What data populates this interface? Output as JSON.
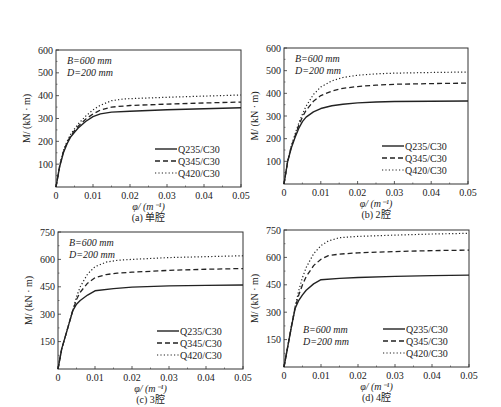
{
  "chart_data": [
    {
      "id": "a",
      "type": "line",
      "caption": "(a) 单腔",
      "xlabel": "φ/ (m⁻¹)",
      "ylabel": "M/ (kN · m)",
      "xlim": [
        0,
        0.05
      ],
      "ylim": [
        0,
        600
      ],
      "xticks": [
        0,
        0.01,
        0.02,
        0.03,
        0.04,
        0.05
      ],
      "xtick_labels": [
        "0",
        "0.01",
        "0.02",
        "0.03",
        "0.04",
        "0.05"
      ],
      "yticks": [
        100,
        200,
        300,
        400,
        500,
        600
      ],
      "ytick_labels": [
        "100",
        "200",
        "300",
        "400",
        "500",
        "600"
      ],
      "annotations": [
        "B=600 mm",
        "D=200 mm"
      ],
      "annotation_position": "top-left",
      "legend_position": "bottom-right",
      "grid": false,
      "series": [
        {
          "name": "Q235/C30",
          "style": "solid",
          "x": [
            0,
            0.001,
            0.002,
            0.003,
            0.004,
            0.005,
            0.006,
            0.008,
            0.01,
            0.012,
            0.015,
            0.02,
            0.03,
            0.04,
            0.05
          ],
          "y": [
            0,
            90,
            150,
            190,
            220,
            240,
            258,
            287,
            308,
            320,
            328,
            332,
            338,
            343,
            347
          ]
        },
        {
          "name": "Q345/C30",
          "style": "dashed",
          "x": [
            0,
            0.001,
            0.002,
            0.003,
            0.004,
            0.005,
            0.006,
            0.008,
            0.01,
            0.012,
            0.015,
            0.02,
            0.03,
            0.04,
            0.05
          ],
          "y": [
            0,
            92,
            155,
            195,
            225,
            247,
            266,
            297,
            320,
            337,
            350,
            357,
            363,
            368,
            372
          ]
        },
        {
          "name": "Q420/C30",
          "style": "dotted",
          "x": [
            0,
            0.001,
            0.002,
            0.003,
            0.004,
            0.005,
            0.006,
            0.008,
            0.01,
            0.012,
            0.015,
            0.018,
            0.02,
            0.03,
            0.04,
            0.05
          ],
          "y": [
            0,
            95,
            160,
            200,
            232,
            255,
            276,
            310,
            338,
            358,
            378,
            385,
            387,
            393,
            398,
            403
          ]
        }
      ]
    },
    {
      "id": "b",
      "type": "line",
      "caption": "(b) 2腔",
      "xlabel": "φ/ (m⁻¹)",
      "ylabel": "M/ (kN · m)",
      "xlim": [
        0,
        0.05
      ],
      "ylim": [
        0,
        600
      ],
      "xticks": [
        0,
        0.01,
        0.02,
        0.03,
        0.04,
        0.05
      ],
      "xtick_labels": [
        "0",
        "0.01",
        "0.02",
        "0.03",
        "0.04",
        "0.05"
      ],
      "yticks": [
        100,
        200,
        300,
        400,
        500,
        600
      ],
      "ytick_labels": [
        "100",
        "200",
        "300",
        "400",
        "500",
        "600"
      ],
      "annotations": [
        "B=600 mm",
        "D=200 mm"
      ],
      "annotation_position": "top-left",
      "legend_position": "bottom-right",
      "grid": false,
      "series": [
        {
          "name": "Q235/C30",
          "style": "solid",
          "x": [
            0,
            0.001,
            0.002,
            0.003,
            0.004,
            0.005,
            0.006,
            0.008,
            0.01,
            0.013,
            0.016,
            0.02,
            0.025,
            0.03,
            0.04,
            0.05
          ],
          "y": [
            0,
            100,
            160,
            205,
            245,
            275,
            295,
            318,
            333,
            345,
            352,
            358,
            362,
            364,
            365,
            366
          ]
        },
        {
          "name": "Q345/C30",
          "style": "dashed",
          "x": [
            0,
            0.001,
            0.002,
            0.003,
            0.004,
            0.005,
            0.006,
            0.008,
            0.01,
            0.013,
            0.016,
            0.02,
            0.025,
            0.03,
            0.04,
            0.05
          ],
          "y": [
            0,
            100,
            165,
            212,
            258,
            295,
            325,
            365,
            390,
            410,
            422,
            430,
            436,
            440,
            443,
            445
          ]
        },
        {
          "name": "Q420/C30",
          "style": "dotted",
          "x": [
            0,
            0.001,
            0.002,
            0.003,
            0.004,
            0.005,
            0.006,
            0.008,
            0.01,
            0.013,
            0.016,
            0.02,
            0.025,
            0.03,
            0.04,
            0.05
          ],
          "y": [
            0,
            102,
            170,
            220,
            268,
            308,
            343,
            395,
            428,
            455,
            470,
            480,
            486,
            489,
            492,
            494
          ]
        }
      ]
    },
    {
      "id": "c",
      "type": "line",
      "caption": "(c) 3腔",
      "xlabel": "φ/ (m⁻¹)",
      "ylabel": "M/ (kN · m)",
      "xlim": [
        0,
        0.05
      ],
      "ylim": [
        0,
        750
      ],
      "xticks": [
        0,
        0.01,
        0.02,
        0.03,
        0.04,
        0.05
      ],
      "xtick_labels": [
        "0",
        "0.01",
        "0.02",
        "0.03",
        "0.04",
        "0.05"
      ],
      "yticks": [
        150,
        300,
        450,
        600,
        750
      ],
      "ytick_labels": [
        "150",
        "300",
        "450",
        "600",
        "750"
      ],
      "annotations": [
        "B=600 mm",
        "D=200 mm"
      ],
      "annotation_position": "top-left",
      "legend_position": "bottom-right",
      "grid": false,
      "series": [
        {
          "name": "Q235/C30",
          "style": "solid",
          "x": [
            0,
            0.001,
            0.002,
            0.003,
            0.004,
            0.005,
            0.006,
            0.008,
            0.01,
            0.015,
            0.02,
            0.03,
            0.04,
            0.05
          ],
          "y": [
            0,
            110,
            180,
            250,
            320,
            355,
            375,
            405,
            428,
            440,
            448,
            455,
            458,
            460
          ]
        },
        {
          "name": "Q345/C30",
          "style": "dashed",
          "x": [
            0,
            0.001,
            0.002,
            0.003,
            0.004,
            0.005,
            0.006,
            0.008,
            0.01,
            0.013,
            0.016,
            0.02,
            0.03,
            0.04,
            0.05
          ],
          "y": [
            0,
            110,
            180,
            250,
            320,
            380,
            420,
            470,
            500,
            517,
            525,
            530,
            540,
            546,
            550
          ]
        },
        {
          "name": "Q420/C30",
          "style": "dotted",
          "x": [
            0,
            0.001,
            0.002,
            0.003,
            0.004,
            0.005,
            0.006,
            0.008,
            0.01,
            0.013,
            0.016,
            0.02,
            0.03,
            0.04,
            0.05
          ],
          "y": [
            0,
            110,
            180,
            250,
            320,
            395,
            450,
            520,
            560,
            585,
            595,
            600,
            610,
            615,
            620
          ]
        }
      ]
    },
    {
      "id": "d",
      "type": "line",
      "caption": "(d) 4腔",
      "xlabel": "φ/ (m⁻¹)",
      "ylabel": "M/ (kN · m)",
      "xlim": [
        0,
        0.05
      ],
      "ylim": [
        0,
        750
      ],
      "xticks": [
        0,
        0.01,
        0.02,
        0.03,
        0.04,
        0.05
      ],
      "xtick_labels": [
        "0",
        "0.01",
        "0.02",
        "0.03",
        "0.04",
        "0.05"
      ],
      "yticks": [
        150,
        300,
        450,
        600,
        750
      ],
      "ytick_labels": [
        "150",
        "300",
        "450",
        "600",
        "750"
      ],
      "annotations": [
        "B=600 mm",
        "D=200 mm"
      ],
      "annotation_position": "bottom-left",
      "legend_position": "bottom-right",
      "grid": false,
      "series": [
        {
          "name": "Q235/C30",
          "style": "solid",
          "x": [
            0,
            0.001,
            0.002,
            0.003,
            0.004,
            0.005,
            0.006,
            0.008,
            0.01,
            0.015,
            0.02,
            0.03,
            0.04,
            0.05
          ],
          "y": [
            0,
            110,
            220,
            320,
            365,
            395,
            420,
            455,
            478,
            485,
            490,
            496,
            500,
            503
          ]
        },
        {
          "name": "Q345/C30",
          "style": "dashed",
          "x": [
            0,
            0.001,
            0.002,
            0.003,
            0.004,
            0.005,
            0.006,
            0.008,
            0.01,
            0.012,
            0.015,
            0.02,
            0.03,
            0.04,
            0.05
          ],
          "y": [
            0,
            110,
            220,
            325,
            395,
            450,
            495,
            555,
            590,
            610,
            618,
            625,
            632,
            637,
            640
          ]
        },
        {
          "name": "Q420/C30",
          "style": "dotted",
          "x": [
            0,
            0.001,
            0.002,
            0.003,
            0.004,
            0.005,
            0.006,
            0.008,
            0.01,
            0.012,
            0.015,
            0.02,
            0.03,
            0.04,
            0.05
          ],
          "y": [
            0,
            110,
            225,
            330,
            420,
            490,
            545,
            620,
            665,
            690,
            708,
            715,
            722,
            728,
            732
          ]
        }
      ]
    }
  ]
}
